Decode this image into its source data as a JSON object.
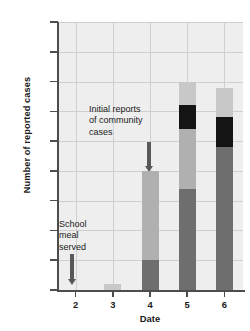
{
  "chart_data": {
    "type": "bar",
    "stacked": true,
    "title": "",
    "xlabel": "Date",
    "ylabel": "Number of reported cases",
    "categories": [
      "2",
      "3",
      "4",
      "5",
      "6"
    ],
    "x": [
      2,
      3,
      4,
      5,
      6
    ],
    "ylim": [
      0,
      45
    ],
    "yticks": [
      0,
      5,
      10,
      15,
      20,
      25,
      30,
      35,
      40,
      45
    ],
    "ytick_labels": [
      "0",
      "5",
      "10",
      "15",
      "20",
      "25",
      "30",
      "35",
      "40",
      "45"
    ],
    "grid": true,
    "legend": "none",
    "series": [
      {
        "name": "segment-1-dark-gray",
        "color": "#6e6e6e",
        "values": [
          0,
          0,
          5,
          17,
          24
        ]
      },
      {
        "name": "segment-2-medium-gray",
        "color": "#b0b0b0",
        "values": [
          0,
          0,
          15,
          10,
          0
        ]
      },
      {
        "name": "segment-3-black",
        "color": "#141414",
        "values": [
          0,
          0,
          0,
          4,
          5
        ]
      },
      {
        "name": "segment-4-light-gray",
        "color": "#c8c8c8",
        "values": [
          0,
          1,
          0,
          4,
          5
        ]
      }
    ],
    "totals": [
      0,
      1,
      20,
      35,
      34
    ],
    "annotations": [
      {
        "name": "school-meal-annotation",
        "text_lines": [
          "School",
          "meal",
          "served"
        ],
        "points_to_date": "2",
        "arrow": "down"
      },
      {
        "name": "community-cases-annotation",
        "text_lines": [
          "Initial reports",
          "of community",
          "cases"
        ],
        "points_to_date": "4",
        "arrow": "down"
      }
    ]
  },
  "figure": {
    "ylabel": "Number of reported cases",
    "xlabel": "Date",
    "yticks": [
      "45",
      "40",
      "35",
      "30",
      "25",
      "20",
      "15",
      "10",
      "5",
      "0"
    ],
    "xticks": [
      "2",
      "3",
      "4",
      "5",
      "6"
    ],
    "annotation_school": {
      "line1": "School",
      "line2": "meal",
      "line3": "served"
    },
    "annotation_community": {
      "line1": "Initial reports",
      "line2": "of community",
      "line3": "cases"
    }
  },
  "colors": {
    "plot_background": "#eeeeee",
    "gridline": "#cfcfcf",
    "axis": "#4d4d4d",
    "arrow": "#595959",
    "seg_dark": "#6e6e6e",
    "seg_medium": "#b0b0b0",
    "seg_black": "#141414",
    "seg_light": "#c8c8c8"
  }
}
